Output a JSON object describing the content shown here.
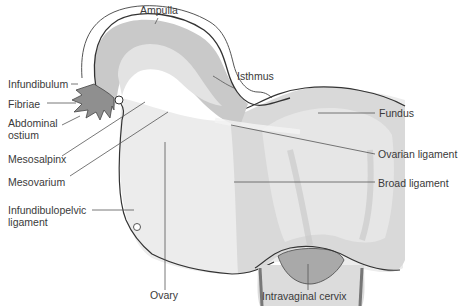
{
  "diagram": {
    "colors": {
      "background": "#ffffff",
      "outline": "#333333",
      "leader_line": "#555555",
      "tube_fill": "#c9c9c9",
      "tube_inner": "#e3e3e3",
      "broad_ligament_fill": "#ececec",
      "uterus_fill": "#d9d9d9",
      "uterus_inner": "#e8e8e8",
      "cervix_fill": "#a9a9a9",
      "fimbriae_fill": "#8f8f8f",
      "label_text": "#3a3a3a"
    },
    "labels": {
      "ampulla": "Ampulla",
      "isthmus": "Isthmus",
      "infundibulum": "Infundibulum",
      "fibriae": "Fibriae",
      "abdominal_ostium_line1": "Abdominal",
      "abdominal_ostium_line2": "ostium",
      "fundus": "Fundus",
      "mesosalpinx": "Mesosalpinx",
      "mesovarium": "Mesovarium",
      "ovarian_ligament": "Ovarian ligament",
      "broad_ligament": "Broad ligament",
      "infundibulopelvic_line1": "Infundibulopelvic",
      "infundibulopelvic_line2": "ligament",
      "ovary": "Ovary",
      "intravaginal_cervix": "Intravaginal cervix"
    }
  }
}
